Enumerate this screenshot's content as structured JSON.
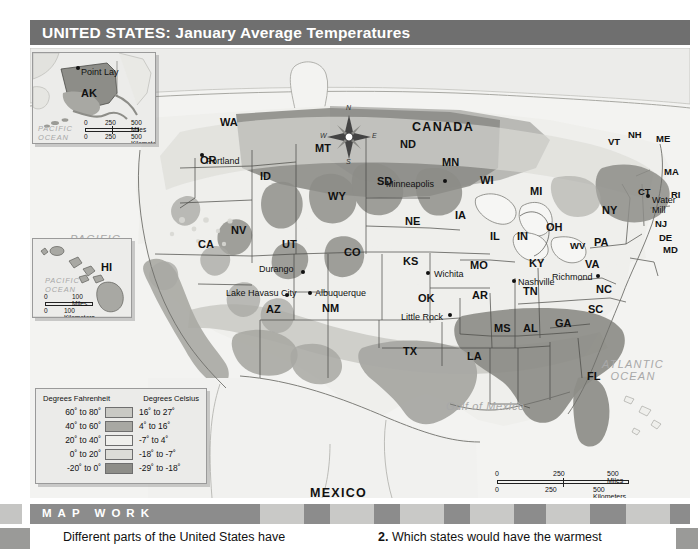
{
  "title": "UNITED STATES: January Average Temperatures",
  "map": {
    "countries": [
      {
        "name": "CANADA",
        "x": 412,
        "y": 78
      },
      {
        "name": "MEXICO",
        "x": 310,
        "y": 444
      }
    ],
    "oceans": [
      {
        "name": "PACIFIC\nOCEAN",
        "x": 70,
        "y": 193
      },
      {
        "name": "ATLANTIC\nOCEAN",
        "x": 603,
        "y": 318
      },
      {
        "name": "Gulf of Mexico",
        "x": 452,
        "y": 404
      }
    ],
    "compass": {
      "north": "N",
      "south": "S",
      "east": "E",
      "west": "W"
    },
    "states": [
      {
        "abbr": "WA",
        "x": 198,
        "y": 122
      },
      {
        "abbr": "OR",
        "x": 178,
        "y": 158
      },
      {
        "abbr": "ID",
        "x": 237,
        "y": 173
      },
      {
        "abbr": "MT",
        "x": 291,
        "y": 147
      },
      {
        "abbr": "ND",
        "x": 378,
        "y": 142
      },
      {
        "abbr": "MN",
        "x": 420,
        "y": 160
      },
      {
        "abbr": "SD",
        "x": 355,
        "y": 180
      },
      {
        "abbr": "WI",
        "x": 458,
        "y": 178
      },
      {
        "abbr": "WY",
        "x": 307,
        "y": 196
      },
      {
        "abbr": "MI",
        "x": 508,
        "y": 189
      },
      {
        "abbr": "NY",
        "x": 580,
        "y": 209
      },
      {
        "abbr": "NV",
        "x": 209,
        "y": 229
      },
      {
        "abbr": "NE",
        "x": 383,
        "y": 220
      },
      {
        "abbr": "IA",
        "x": 432,
        "y": 213
      },
      {
        "abbr": "IL",
        "x": 467,
        "y": 234
      },
      {
        "abbr": "IN",
        "x": 494,
        "y": 234
      },
      {
        "abbr": "OH",
        "x": 524,
        "y": 225
      },
      {
        "abbr": "PA",
        "x": 572,
        "y": 240
      },
      {
        "abbr": "CA",
        "x": 176,
        "y": 242
      },
      {
        "abbr": "UT",
        "x": 260,
        "y": 243
      },
      {
        "abbr": "CO",
        "x": 322,
        "y": 251
      },
      {
        "abbr": "KS",
        "x": 381,
        "y": 260
      },
      {
        "abbr": "MO",
        "x": 448,
        "y": 264
      },
      {
        "abbr": "KY",
        "x": 507,
        "y": 262
      },
      {
        "abbr": "WV",
        "x": 548,
        "y": 244
      },
      {
        "abbr": "VA",
        "x": 563,
        "y": 262
      },
      {
        "abbr": "AZ",
        "x": 244,
        "y": 308
      },
      {
        "abbr": "NM",
        "x": 300,
        "y": 307
      },
      {
        "abbr": "OK",
        "x": 396,
        "y": 297
      },
      {
        "abbr": "AR",
        "x": 450,
        "y": 294
      },
      {
        "abbr": "TN",
        "x": 501,
        "y": 290
      },
      {
        "abbr": "NC",
        "x": 574,
        "y": 288
      },
      {
        "abbr": "SC",
        "x": 566,
        "y": 308
      },
      {
        "abbr": "MS",
        "x": 472,
        "y": 327
      },
      {
        "abbr": "AL",
        "x": 501,
        "y": 327
      },
      {
        "abbr": "GA",
        "x": 533,
        "y": 322
      },
      {
        "abbr": "TX",
        "x": 381,
        "y": 350
      },
      {
        "abbr": "LA",
        "x": 445,
        "y": 355
      },
      {
        "abbr": "FL",
        "x": 565,
        "y": 375
      },
      {
        "abbr": "VT",
        "x": 585,
        "y": 140
      },
      {
        "abbr": "NH",
        "x": 606,
        "y": 133
      },
      {
        "abbr": "ME",
        "x": 635,
        "y": 137
      },
      {
        "abbr": "MA",
        "x": 642,
        "y": 170
      },
      {
        "abbr": "CT",
        "x": 616,
        "y": 190
      },
      {
        "abbr": "RI",
        "x": 648,
        "y": 193
      },
      {
        "abbr": "NJ",
        "x": 633,
        "y": 222
      },
      {
        "abbr": "DE",
        "x": 637,
        "y": 236
      },
      {
        "abbr": "MD",
        "x": 641,
        "y": 248
      }
    ],
    "cities": [
      {
        "name": "Portland",
        "lx": 184,
        "ly": 160,
        "dx": 178,
        "dy": 158
      },
      {
        "name": "Minneapolis",
        "lx": 384,
        "ly": 183,
        "dx": 424,
        "dy": 180
      },
      {
        "name": "Durango",
        "lx": 259,
        "ly": 268,
        "dx": 295,
        "dy": 273
      },
      {
        "name": "Wichita",
        "lx": 403,
        "ly": 273,
        "dx": 399,
        "dy": 272
      },
      {
        "name": "Lake Havasu City",
        "lx": 227,
        "ly": 292,
        "dx": 262,
        "dy": 297
      },
      {
        "name": "Albuquerque",
        "lx": 312,
        "ly": 292,
        "dx": 308,
        "dy": 292
      },
      {
        "name": "Little Rock",
        "lx": 401,
        "ly": 316,
        "dx": 443,
        "dy": 314
      },
      {
        "name": "Nashville",
        "lx": 515,
        "ly": 281,
        "dx": 512,
        "dy": 280
      },
      {
        "name": "Richmond",
        "lx": 546,
        "ly": 276,
        "dx": 588,
        "dy": 276
      },
      {
        "name": "Water Mill",
        "lx": 630,
        "ly": 198,
        "dx": 627,
        "dy": 194
      }
    ]
  },
  "insets": {
    "alaska": {
      "state": "AK",
      "city": "Point Lay",
      "ocean": "PACIFIC\nOCEAN",
      "scale_miles": {
        "zero": "0",
        "mid": "250",
        "end": "500 Miles"
      },
      "scale_km": {
        "zero": "0",
        "mid": "250",
        "end": "500 Kilometers"
      }
    },
    "hawaii": {
      "state": "HI",
      "ocean": "PACIFIC\nOCEAN",
      "scale_miles": {
        "zero": "0",
        "end": "100 Miles"
      },
      "scale_km": {
        "zero": "0",
        "end": "100 Kilometers"
      }
    }
  },
  "main_scale": {
    "miles": {
      "zero": "0",
      "mid": "250",
      "end": "500 Miles"
    },
    "km": {
      "zero": "0",
      "mid": "250",
      "end": "500 Kilometers"
    }
  },
  "legend": {
    "header_fahrenheit": "Degrees Fahrenheit",
    "header_celsius": "Degrees Celsius",
    "rows": [
      {
        "f": "60˚ to 80˚",
        "c": "16˚ to 27˚",
        "color": "#c9c9c4"
      },
      {
        "f": "40˚ to 60˚",
        "c": "4˚ to 16˚",
        "color": "#a8a8a3"
      },
      {
        "f": "20˚ to 40˚",
        "c": "-7˚ to 4˚",
        "color": "#efefec"
      },
      {
        "f": "0˚ to 20˚",
        "c": "-18˚ to -7˚",
        "color": "#dcdcd7"
      },
      {
        "f": "-20˚ to 0˚",
        "c": "-29˚ to -18˚",
        "color": "#8d8d88"
      }
    ]
  },
  "mapwork": {
    "banner": "M A P   W O R K",
    "question_left": "Different parts of the United States have",
    "question_right_num": "2.",
    "question_right": " Which states would have the warmest"
  },
  "colors": {
    "title_bar": "#6f6f6f",
    "banner": "#8c8c8c",
    "map_bg": "#f2f2f0"
  }
}
